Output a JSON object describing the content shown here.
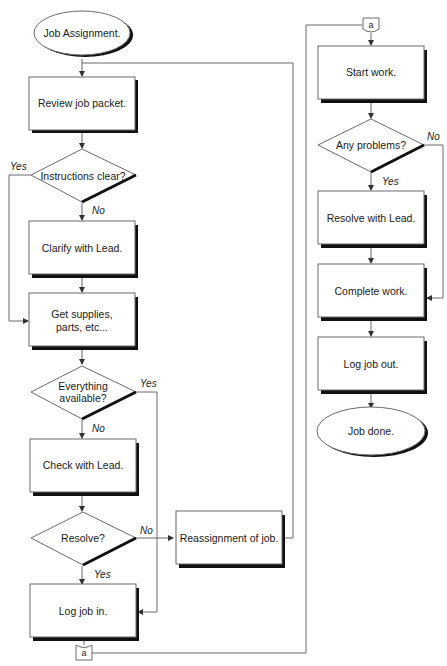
{
  "diagram": {
    "type": "flowchart",
    "colors": {
      "stroke": "#6b6b6b",
      "shadow": "#111111",
      "text": "#1a1a1a",
      "background": "#ffffff"
    },
    "nodes": {
      "job_assignment": {
        "shape": "terminator",
        "label": "Job Assignment."
      },
      "review_job_packet": {
        "shape": "process",
        "label": "Review job packet."
      },
      "instructions_clear": {
        "shape": "decision",
        "label": "Instructions clear?"
      },
      "clarify_with_lead": {
        "shape": "process",
        "label": "Clarify with Lead."
      },
      "get_supplies": {
        "shape": "process",
        "label_line1": "Get supplies,",
        "label_line2": "parts, etc..."
      },
      "everything_available": {
        "shape": "decision",
        "label_line1": "Everything",
        "label_line2": "available?"
      },
      "check_with_lead": {
        "shape": "process",
        "label": "Check with Lead."
      },
      "resolve": {
        "shape": "decision",
        "label": "Resolve?"
      },
      "reassignment_of_job": {
        "shape": "process",
        "label": "Reassignment of job."
      },
      "log_job_in": {
        "shape": "process",
        "label": "Log job in."
      },
      "connector_bottom": {
        "shape": "off-page-connector",
        "label": "a"
      },
      "connector_top": {
        "shape": "off-page-connector",
        "label": "a"
      },
      "start_work": {
        "shape": "process",
        "label": "Start work."
      },
      "any_problems": {
        "shape": "decision",
        "label": "Any problems?"
      },
      "resolve_with_lead": {
        "shape": "process",
        "label": "Resolve with Lead."
      },
      "complete_work": {
        "shape": "process",
        "label": "Complete work."
      },
      "log_job_out": {
        "shape": "process",
        "label": "Log job out."
      },
      "job_done": {
        "shape": "terminator",
        "label": "Job done."
      }
    },
    "edge_labels": {
      "instructions_yes": "Yes",
      "instructions_no": "No",
      "available_yes": "Yes",
      "available_no": "No",
      "resolve_no": "No",
      "resolve_yes": "Yes",
      "problems_no": "No",
      "problems_yes": "Yes"
    },
    "edges": [
      {
        "from": "job_assignment",
        "to": "review_job_packet"
      },
      {
        "from": "review_job_packet",
        "to": "instructions_clear"
      },
      {
        "from": "instructions_clear",
        "to": "clarify_with_lead",
        "label": "No"
      },
      {
        "from": "instructions_clear",
        "to": "get_supplies",
        "label": "Yes"
      },
      {
        "from": "clarify_with_lead",
        "to": "get_supplies"
      },
      {
        "from": "get_supplies",
        "to": "everything_available"
      },
      {
        "from": "everything_available",
        "to": "check_with_lead",
        "label": "No"
      },
      {
        "from": "everything_available",
        "to": "log_job_in",
        "label": "Yes"
      },
      {
        "from": "check_with_lead",
        "to": "resolve"
      },
      {
        "from": "resolve",
        "to": "reassignment_of_job",
        "label": "No"
      },
      {
        "from": "resolve",
        "to": "log_job_in",
        "label": "Yes"
      },
      {
        "from": "reassignment_of_job",
        "to": "review_job_packet"
      },
      {
        "from": "log_job_in",
        "to": "connector_bottom"
      },
      {
        "from": "connector_bottom",
        "to": "connector_top"
      },
      {
        "from": "connector_top",
        "to": "start_work"
      },
      {
        "from": "start_work",
        "to": "any_problems"
      },
      {
        "from": "any_problems",
        "to": "resolve_with_lead",
        "label": "Yes"
      },
      {
        "from": "any_problems",
        "to": "complete_work",
        "label": "No"
      },
      {
        "from": "resolve_with_lead",
        "to": "complete_work"
      },
      {
        "from": "complete_work",
        "to": "log_job_out"
      },
      {
        "from": "log_job_out",
        "to": "job_done"
      }
    ]
  }
}
